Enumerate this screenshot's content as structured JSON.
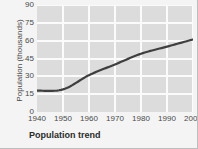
{
  "chart_data": {
    "type": "line",
    "title": "Population trend",
    "xlabel": "",
    "ylabel": "Population (thousands)",
    "x": [
      1940,
      1950,
      1960,
      1970,
      1980,
      1990,
      2000
    ],
    "xtick_labels": [
      "1940",
      "1950",
      "1960",
      "1970",
      "1980",
      "1990",
      "2000"
    ],
    "ytick_labels": [
      "0",
      "15",
      "30",
      "45",
      "60",
      "75",
      "90"
    ],
    "ytick_values": [
      0,
      15,
      30,
      45,
      60,
      75,
      90
    ],
    "values": [
      18,
      19,
      31,
      40,
      49,
      55,
      61
    ],
    "series": [
      {
        "name": "Population",
        "values": [
          18,
          19,
          31,
          40,
          49,
          55,
          61
        ]
      }
    ],
    "xlim": [
      1940,
      2000
    ],
    "ylim": [
      0,
      90
    ],
    "grid": true,
    "legend": "none",
    "line_color": "#3f3f3f",
    "plot_background": "#dcdcdc",
    "gridline_color": "#fbfbfb",
    "figure_background": "#f4f4f4"
  }
}
